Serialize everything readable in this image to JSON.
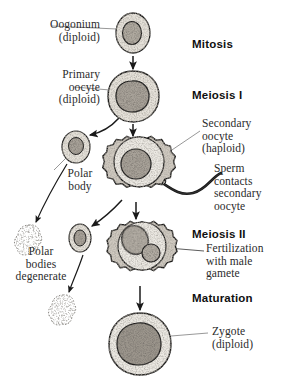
{
  "diagram": {
    "colors": {
      "ink": "#1a1a1a",
      "leader": "#8c8c8c",
      "cytoplasm": "#dedad2",
      "nucleus": "#a9a49a",
      "text": "#2b2b2b",
      "stage_text": "#101010",
      "background": "#ffffff"
    },
    "stage_labels": [
      {
        "id": "mitosis",
        "text": "Mitosis",
        "x": 192,
        "y": 38
      },
      {
        "id": "meiosis-i",
        "text": "Meiosis I",
        "x": 192,
        "y": 89
      },
      {
        "id": "meiosis-ii",
        "text": "Meiosis II",
        "x": 192,
        "y": 228
      },
      {
        "id": "maturation",
        "text": "Maturation",
        "x": 192,
        "y": 292
      }
    ],
    "cell_labels": [
      {
        "id": "oogonium",
        "text": "Oogonium\n(diploid)",
        "x": 4,
        "y": 18,
        "w": 96,
        "align": "right"
      },
      {
        "id": "primary-oocyte",
        "text": "Primary\noocyte\n(diploid)",
        "x": 4,
        "y": 68,
        "w": 96,
        "align": "right"
      },
      {
        "id": "polar-body",
        "text": "Polar\nbody",
        "x": 52,
        "y": 170,
        "w": 56,
        "align": "center"
      },
      {
        "id": "polar-bodies-degenerate",
        "text": "Polar\nbodies\ndegenerate",
        "x": 0,
        "y": 248,
        "w": 80,
        "align": "center"
      },
      {
        "id": "secondary-oocyte",
        "text": "Secondary\noocyte\n(haploid)",
        "x": 202,
        "y": 118,
        "w": 78,
        "align": "left"
      },
      {
        "id": "sperm-contacts",
        "text": "Sperm\ncontacts\nsecondary\noocyte",
        "x": 214,
        "y": 163,
        "w": 66,
        "align": "left"
      },
      {
        "id": "fertilization",
        "text": "Fertilization\nwith male\ngamete",
        "x": 206,
        "y": 243,
        "w": 74,
        "align": "left"
      },
      {
        "id": "zygote",
        "text": "Zygote\n(diploid)",
        "x": 212,
        "y": 325,
        "w": 68,
        "align": "left"
      }
    ],
    "cells": [
      {
        "id": "oogonium-cell",
        "type": "round-cell",
        "cx": 133,
        "cy": 33,
        "rx": 17,
        "ry": 20,
        "nucleus_rx": 9,
        "nucleus_ry": 11,
        "nucleus_dx": -1,
        "nucleus_dy": 0
      },
      {
        "id": "primary-oocyte-cell",
        "type": "round-cell",
        "cx": 133,
        "cy": 96,
        "rx": 25,
        "ry": 25,
        "nucleus_rx": 15,
        "nucleus_ry": 16,
        "nucleus_dx": -1,
        "nucleus_dy": 0
      },
      {
        "id": "polar-body-cell",
        "type": "round-cell",
        "cx": 76,
        "cy": 147,
        "rx": 14,
        "ry": 16,
        "nucleus_rx": 7,
        "nucleus_ry": 8,
        "nucleus_dx": 0,
        "nucleus_dy": -1
      },
      {
        "id": "secondary-oocyte-cell",
        "type": "scalloped-cell",
        "cx": 139,
        "cy": 168,
        "r": 31,
        "nucleus_r": 15,
        "nucleus_dx": -3,
        "nucleus_dy": 2
      },
      {
        "id": "second-polar-body-cell",
        "type": "round-cell",
        "cx": 80,
        "cy": 238,
        "rx": 11,
        "ry": 14,
        "nucleus_rx": 6,
        "nucleus_ry": 8,
        "nucleus_dx": 0,
        "nucleus_dy": 0
      },
      {
        "id": "fertilized-cell",
        "type": "scalloped-cell",
        "cx": 142,
        "cy": 252,
        "r": 30,
        "nucleus_r": 14,
        "nucleus_dx": -7,
        "nucleus_dy": -5,
        "second_nucleus_r": 9,
        "second_nucleus_dx": 9,
        "second_nucleus_dy": 5
      },
      {
        "id": "zygote-cell",
        "type": "round-cell",
        "cx": 140,
        "cy": 344,
        "rx": 30,
        "ry": 30,
        "nucleus_rx": 20,
        "nucleus_ry": 20,
        "nucleus_dx": -2,
        "nucleus_dy": -1
      },
      {
        "id": "degenerate-blob-upper",
        "type": "blob",
        "cx": 29,
        "cy": 238
      },
      {
        "id": "degenerate-blob-lower",
        "type": "blob",
        "cx": 63,
        "cy": 308
      }
    ],
    "arrows": [
      {
        "id": "arrow-oogonium-to-primary",
        "kind": "straight",
        "x1": 133,
        "y1": 56,
        "x2": 133,
        "y2": 68
      },
      {
        "id": "arrow-primary-to-secondary",
        "kind": "straight",
        "x1": 133,
        "y1": 123,
        "x2": 133,
        "y2": 136
      },
      {
        "id": "arrow-primary-to-polar-body",
        "kind": "curved",
        "x1": 116,
        "y1": 117,
        "x2": 88,
        "y2": 136
      },
      {
        "id": "arrow-polar-body-to-degenerate",
        "kind": "curved",
        "x1": 66,
        "y1": 163,
        "x2": 34,
        "y2": 224
      },
      {
        "id": "arrow-secondary-to-fertilized",
        "kind": "straight",
        "x1": 136,
        "y1": 201,
        "x2": 136,
        "y2": 219
      },
      {
        "id": "arrow-secondary-to-second-polar",
        "kind": "curved",
        "x1": 118,
        "y1": 198,
        "x2": 90,
        "y2": 226
      },
      {
        "id": "arrow-second-polar-to-degenerate",
        "kind": "curved",
        "x1": 82,
        "y1": 254,
        "x2": 68,
        "y2": 293
      },
      {
        "id": "arrow-fertilized-to-zygote",
        "kind": "straight",
        "x1": 140,
        "y1": 285,
        "x2": 140,
        "y2": 310
      }
    ],
    "leaders": [
      {
        "id": "leader-oogonium",
        "x1": 52,
        "y1": 26,
        "x2": 117,
        "y2": 29
      },
      {
        "id": "leader-primary-oocyte",
        "x1": 74,
        "y1": 87,
        "x2": 110,
        "y2": 89
      },
      {
        "id": "leader-secondary-oocyte",
        "x1": 200,
        "y1": 131,
        "x2": 163,
        "y2": 156
      },
      {
        "id": "leader-polar-body",
        "x1": 52,
        "y1": 170,
        "x2": 66,
        "y2": 157
      },
      {
        "id": "leader-fertilization",
        "x1": 204,
        "y1": 251,
        "x2": 168,
        "y2": 248
      },
      {
        "id": "leader-zygote",
        "x1": 208,
        "y1": 333,
        "x2": 171,
        "y2": 336
      }
    ],
    "sperm": {
      "id": "sperm-tail",
      "description": "wavy tail contacting secondary oocyte",
      "path": "M 158 180 C 170 186, 176 193, 190 192 C 204 191, 210 178, 218 175"
    }
  }
}
